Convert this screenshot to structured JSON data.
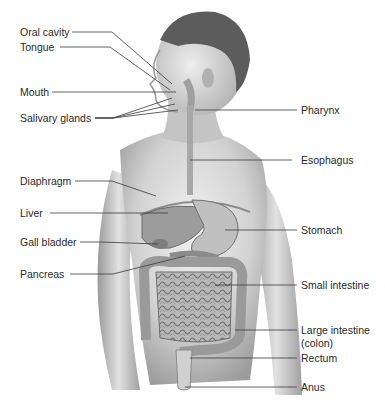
{
  "diagram": {
    "left_labels": [
      {
        "id": "oral-cavity",
        "text": "Oral cavity"
      },
      {
        "id": "tongue",
        "text": "Tongue"
      },
      {
        "id": "mouth",
        "text": "Mouth"
      },
      {
        "id": "salivary-glands",
        "text": "Salivary glands"
      },
      {
        "id": "diaphragm",
        "text": "Diaphragm"
      },
      {
        "id": "liver",
        "text": "Liver"
      },
      {
        "id": "gall-bladder",
        "text": "Gall bladder"
      },
      {
        "id": "pancreas",
        "text": "Pancreas"
      }
    ],
    "right_labels": [
      {
        "id": "pharynx",
        "text": "Pharynx"
      },
      {
        "id": "esophagus",
        "text": "Esophagus"
      },
      {
        "id": "stomach",
        "text": "Stomach"
      },
      {
        "id": "small-intestine",
        "text": "Small intestine"
      },
      {
        "id": "large-intestine",
        "text": "Large intestine"
      },
      {
        "id": "large-intestine-sub",
        "text": "(colon)"
      },
      {
        "id": "rectum",
        "text": "Rectum"
      },
      {
        "id": "anus",
        "text": "Anus"
      }
    ],
    "colors": {
      "line": "#3a3a3a",
      "skin_light": "#e6e6e6",
      "skin_mid": "#bdbdbd",
      "skin_dark": "#8a8a8a",
      "hair": "#5a5a5a"
    }
  }
}
